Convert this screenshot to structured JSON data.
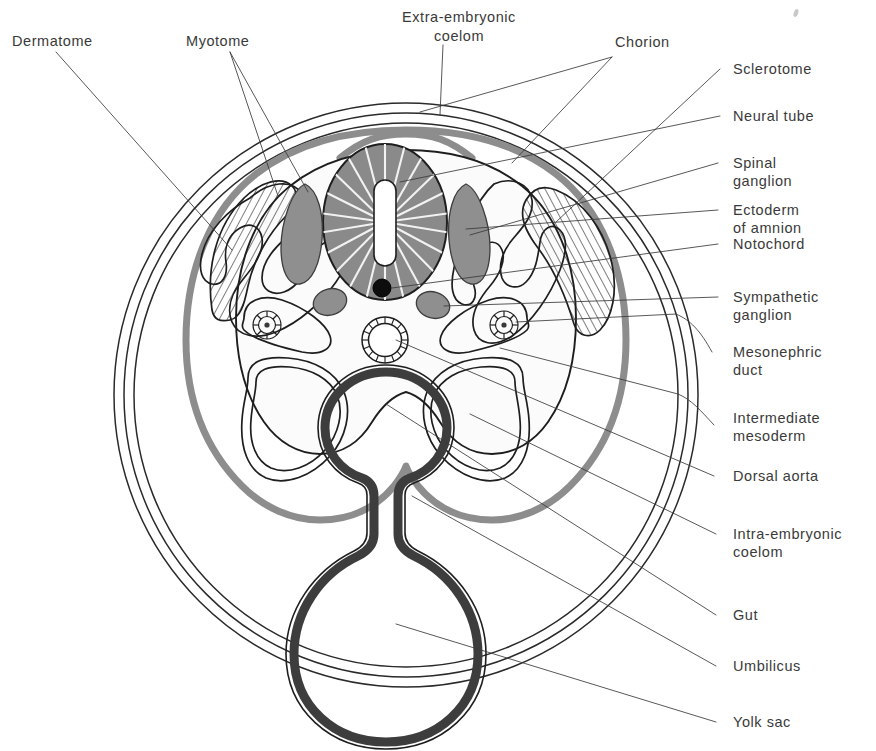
{
  "figure": {
    "colors": {
      "ink": "#2a2a2a",
      "label_text": "#3a3a3a",
      "amnion_gray": "#8d8d8d",
      "organ_gray": "#8f8f8f",
      "gut_dark": "#3d3d3d",
      "notochord_black": "#0d0d0d",
      "background": "#ffffff"
    },
    "labels": {
      "dermatome": "Dermatome",
      "myotome": "Myotome",
      "extra_embryonic_coelom_line1": "Extra-embryonic",
      "extra_embryonic_coelom_line2": "coelom",
      "chorion": "Chorion",
      "sclerotome": "Sclerotome",
      "neural_tube": "Neural tube",
      "spinal_ganglion_line1": "Spinal",
      "spinal_ganglion_line2": "ganglion",
      "ectoderm_of_amnion_line1": "Ectoderm",
      "ectoderm_of_amnion_line2": "of amnion",
      "notochord": "Notochord",
      "sympathetic_ganglion_line1": "Sympathetic",
      "sympathetic_ganglion_line2": "ganglion",
      "mesonephric_duct_line1": "Mesonephric",
      "mesonephric_duct_line2": "duct",
      "intermediate_mesoderm_line1": "Intermediate",
      "intermediate_mesoderm_line2": "mesoderm",
      "dorsal_aorta": "Dorsal aorta",
      "intra_embryonic_coelom_line1": "Intra-embryonic",
      "intra_embryonic_coelom_line2": "coelom",
      "gut": "Gut",
      "umbilicus": "Umbilicus",
      "yolk_sac": "Yolk sac"
    },
    "structures": [
      {
        "name": "chorion",
        "description": "three concentric thin outer circles"
      },
      {
        "name": "extra-embryonic-coelom",
        "description": "space between chorion and amnion"
      },
      {
        "name": "amnion",
        "description": "thick gray line enclosing embryo"
      },
      {
        "name": "dermatome",
        "description": "hatched outer somite layer, left"
      },
      {
        "name": "myotome",
        "description": "scroll-shaped somite layer"
      },
      {
        "name": "sclerotome",
        "description": "hatched somite layer, right"
      },
      {
        "name": "neural-tube",
        "description": "radially striated oval with slit lumen"
      },
      {
        "name": "spinal-ganglion",
        "description": "paired gray teardrops flanking neural tube"
      },
      {
        "name": "notochord",
        "description": "small solid black dot below neural tube"
      },
      {
        "name": "sympathetic-ganglion",
        "description": "paired small gray ovals"
      },
      {
        "name": "mesonephric-duct",
        "description": "paired spoked-wheel circles"
      },
      {
        "name": "intermediate-mesoderm",
        "description": "tissue bridging somite and coelom"
      },
      {
        "name": "dorsal-aorta",
        "description": "midline circle with segmented wall"
      },
      {
        "name": "intra-embryonic-coelom",
        "description": "paired lateral body cavities"
      },
      {
        "name": "gut",
        "description": "upper dark-walled circle on midline"
      },
      {
        "name": "umbilicus",
        "description": "narrow stalk joining gut to yolk sac"
      },
      {
        "name": "yolk-sac",
        "description": "large lower dark-walled circle"
      }
    ]
  }
}
